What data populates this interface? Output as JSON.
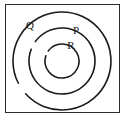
{
  "figure": {
    "type": "concentric-circles-diagram",
    "caption": "",
    "frame": {
      "border_color": "#2b2b2b",
      "background_color": "#ffffff",
      "x": 5,
      "y": 4,
      "width": 115,
      "height": 109
    },
    "center": {
      "cx": 62,
      "cy": 61
    },
    "stroke_color": "#1a1a1a",
    "orbits": [
      {
        "id": "outer",
        "label": "Q",
        "radius": 49,
        "stroke_width": 1.6,
        "gap_start_deg": 228,
        "gap_end_deg": 243,
        "label_x": 30,
        "label_y": 26
      },
      {
        "id": "middle",
        "label": "P",
        "radius": 33,
        "stroke_width": 1.6,
        "gap_start_deg": 291,
        "gap_end_deg": 306,
        "label_x": 76,
        "label_y": 31
      },
      {
        "id": "inner",
        "label": "R",
        "radius": 17,
        "stroke_width": 1.6,
        "gap_start_deg": 288,
        "gap_end_deg": 306,
        "label_x": 71,
        "label_y": 46
      }
    ]
  }
}
